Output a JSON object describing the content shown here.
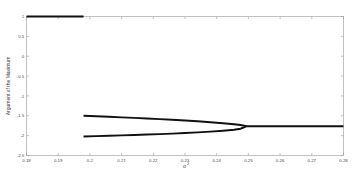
{
  "chart_data": {
    "type": "line",
    "title": "",
    "xlabel": "σ²",
    "ylabel": "Argument of the Maximum",
    "xlim": [
      0.18,
      0.28
    ],
    "ylim": [
      -2.5,
      1.0
    ],
    "grid": false,
    "legend": null,
    "xticks": [
      0.18,
      0.19,
      0.2,
      0.21,
      0.22,
      0.23,
      0.24,
      0.25,
      0.26,
      0.27,
      0.28
    ],
    "xticklabels": [
      "0.18",
      "0.19",
      "0.2",
      "0.21",
      "0.22",
      "0.23",
      "0.24",
      "0.25",
      "0.26",
      "0.27",
      "0.28"
    ],
    "yticks": [
      1,
      0.5,
      0,
      -0.5,
      -1,
      -1.5,
      -2,
      -2.5
    ],
    "yticklabels": [
      "1",
      "0.5",
      "0",
      "-0.5",
      "-1",
      "-1.5",
      "-2",
      "-2.5"
    ],
    "series": [
      {
        "name": "upper-branch",
        "comment": "flat branch at y = 1, terminates near sigma^2 = 0.198",
        "x": [
          0.18,
          0.185,
          0.19,
          0.195,
          0.198
        ],
        "y": [
          1.0,
          1.0,
          1.0,
          1.0,
          1.0
        ]
      },
      {
        "name": "middle-branch",
        "comment": "rises from -1.50 at 0.198 toward merge point -1.76 at 0.2495",
        "x": [
          0.198,
          0.202,
          0.206,
          0.21,
          0.214,
          0.218,
          0.222,
          0.226,
          0.23,
          0.234,
          0.238,
          0.242,
          0.2455,
          0.2475,
          0.2495
        ],
        "y": [
          -1.5,
          -1.512,
          -1.525,
          -1.539,
          -1.553,
          -1.568,
          -1.584,
          -1.601,
          -1.619,
          -1.639,
          -1.661,
          -1.687,
          -1.712,
          -1.732,
          -1.762
        ]
      },
      {
        "name": "lower-branch",
        "comment": "rises from -2.02 at 0.198 toward merge point -1.76 at 0.2495",
        "x": [
          0.198,
          0.202,
          0.206,
          0.21,
          0.214,
          0.218,
          0.222,
          0.226,
          0.23,
          0.234,
          0.238,
          0.242,
          0.2455,
          0.2475,
          0.2495
        ],
        "y": [
          -2.02,
          -2.012,
          -2.003,
          -1.994,
          -1.984,
          -1.973,
          -1.961,
          -1.948,
          -1.934,
          -1.918,
          -1.899,
          -1.876,
          -1.852,
          -1.826,
          -1.762
        ]
      },
      {
        "name": "merged-branch",
        "comment": "single flat branch after merge, y = -1.76 to right edge",
        "x": [
          0.2495,
          0.255,
          0.26,
          0.265,
          0.27,
          0.275,
          0.28
        ],
        "y": [
          -1.762,
          -1.762,
          -1.762,
          -1.762,
          -1.762,
          -1.762,
          -1.762
        ]
      }
    ]
  }
}
